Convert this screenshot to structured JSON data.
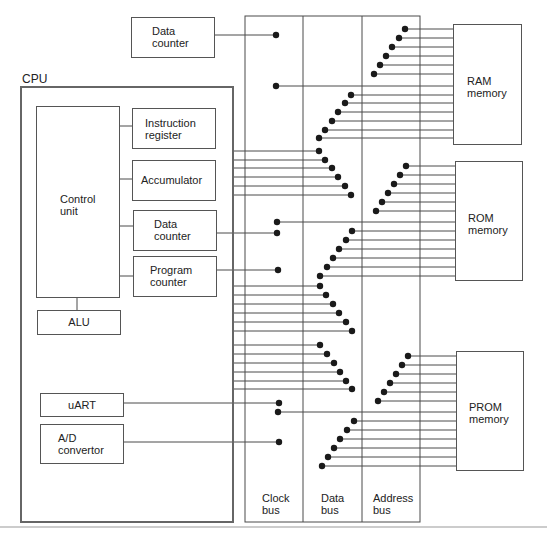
{
  "diagram": {
    "cpu_label": "CPU",
    "external_data_counter": "Data\ncounter",
    "control_unit": "Control\nunit",
    "instruction_register": "Instruction\nregister",
    "accumulator": "Accumulator",
    "data_counter": "Data\ncounter",
    "program_counter": "Program\ncounter",
    "alu": "ALU",
    "uart": "uART",
    "ad_convertor": "A/D\nconvertor",
    "buses": {
      "clock": "Clock\nbus",
      "data": "Data\nbus",
      "address": "Address\nbus"
    },
    "memories": {
      "ram": "RAM\nmemory",
      "rom": "ROM\nmemory",
      "prom": "PROM\nmemory"
    },
    "caption_fragment": "...                    | CPU"
  },
  "colors": {
    "line": "#4a4a4a",
    "dot": "#1a1a1a",
    "background": "#ffffff"
  }
}
